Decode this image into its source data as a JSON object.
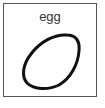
{
  "card": {
    "label": "egg",
    "icon": "egg-outline-icon",
    "stroke_color": "#111111",
    "border_color": "#555555"
  }
}
